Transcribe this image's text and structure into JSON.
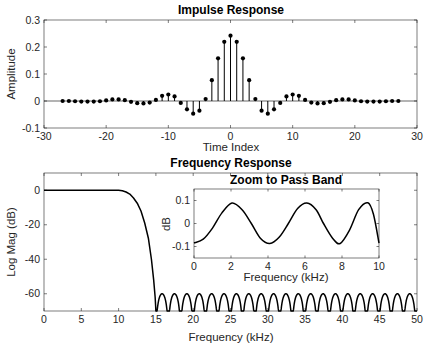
{
  "chart_data": [
    {
      "id": "impulse",
      "type": "stem",
      "title": "Impulse Response",
      "xlabel": "Time Index",
      "ylabel": "Amplitude",
      "xlim": [
        -30,
        30
      ],
      "ylim": [
        -0.1,
        0.3
      ],
      "xticks": [
        -30,
        -20,
        -10,
        0,
        10,
        20,
        30
      ],
      "yticks": [
        -0.1,
        0,
        0.1,
        0.2,
        0.3
      ],
      "grid": false,
      "x": [
        -27,
        -26,
        -25,
        -24,
        -23,
        -22,
        -21,
        -20,
        -19,
        -18,
        -17,
        -16,
        -15,
        -14,
        -13,
        -12,
        -11,
        -10,
        -9,
        -8,
        -7,
        -6,
        -5,
        -4,
        -3,
        -2,
        -1,
        0,
        1,
        2,
        3,
        4,
        5,
        6,
        7,
        8,
        9,
        10,
        11,
        12,
        13,
        14,
        15,
        16,
        17,
        18,
        19,
        20,
        21,
        22,
        23,
        24,
        25,
        26,
        27
      ],
      "values": [
        0.0,
        0.0,
        -0.001,
        -0.002,
        -0.002,
        -0.002,
        -0.001,
        0.002,
        0.006,
        0.006,
        0.003,
        -0.003,
        -0.008,
        -0.009,
        -0.006,
        0.004,
        0.019,
        0.024,
        0.017,
        -0.007,
        -0.031,
        -0.047,
        -0.036,
        0.007,
        0.077,
        0.158,
        0.219,
        0.242,
        0.219,
        0.158,
        0.077,
        0.007,
        -0.036,
        -0.047,
        -0.031,
        -0.007,
        0.017,
        0.024,
        0.019,
        0.004,
        -0.006,
        -0.009,
        -0.008,
        -0.003,
        0.003,
        0.006,
        0.006,
        0.002,
        -0.001,
        -0.002,
        -0.002,
        -0.002,
        -0.001,
        0.0,
        0.0
      ]
    },
    {
      "id": "frequency",
      "type": "line",
      "title": "Frequency Response",
      "xlabel": "Frequency (kHz)",
      "ylabel": "Log Mag (dB)",
      "xlim": [
        0,
        50
      ],
      "ylim": [
        -70,
        10
      ],
      "xticks": [
        0,
        5,
        10,
        15,
        20,
        25,
        30,
        35,
        40,
        45,
        50
      ],
      "yticks": [
        -60,
        -40,
        -20,
        0
      ],
      "grid": false,
      "passband_and_transition": {
        "x": [
          0,
          2,
          4,
          6,
          8,
          10,
          10.5,
          11,
          11.5,
          12,
          12.5,
          13,
          13.5,
          14,
          14.4,
          14.7,
          14.9,
          15
        ],
        "y": [
          0,
          0,
          0,
          0,
          0,
          0,
          -0.3,
          -1,
          -2.2,
          -4.5,
          -7.5,
          -12,
          -19,
          -28,
          -40,
          -52,
          -62,
          -70
        ]
      },
      "stopband": {
        "start_khz": 15,
        "end_khz": 50,
        "lobe_width_khz": 1.66,
        "peak_db": -60,
        "floor_db": -70
      }
    },
    {
      "id": "passband-zoom",
      "type": "line",
      "title": "Zoom to Pass Band",
      "xlabel": "Frequency (kHz)",
      "ylabel": "dB",
      "xlim": [
        0,
        10
      ],
      "ylim": [
        -0.15,
        0.15
      ],
      "xticks": [
        0,
        2,
        4,
        6,
        8,
        10
      ],
      "yticks": [
        -0.1,
        0,
        0.1
      ],
      "grid": false,
      "x": [
        0,
        0.5,
        1,
        1.5,
        2.05,
        2.6,
        3.1,
        3.6,
        4.1,
        4.6,
        5.1,
        5.6,
        6.1,
        6.6,
        7.0,
        7.5,
        7.9,
        8.4,
        8.9,
        9.4,
        9.7,
        10
      ],
      "y": [
        -0.085,
        -0.068,
        -0.02,
        0.045,
        0.089,
        0.06,
        0.0,
        -0.065,
        -0.087,
        -0.06,
        0.0,
        0.065,
        0.089,
        0.06,
        0.0,
        -0.065,
        -0.087,
        -0.03,
        0.06,
        0.09,
        0.04,
        -0.085
      ]
    }
  ]
}
